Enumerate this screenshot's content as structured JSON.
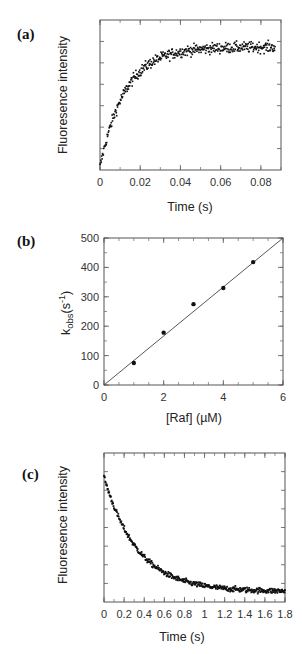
{
  "figure": {
    "panels": [
      {
        "id": "a",
        "label": "(a)"
      },
      {
        "id": "b",
        "label": "(b)"
      },
      {
        "id": "c",
        "label": "(c)"
      }
    ]
  },
  "chart_data": [
    {
      "panel": "(a)",
      "type": "scatter",
      "title": "",
      "xlabel": "Time (s)",
      "ylabel": "Fluoresence intensity",
      "xlim": [
        0,
        0.09
      ],
      "ylim": [
        0,
        1
      ],
      "xticks": [
        0,
        0.02,
        0.04,
        0.06,
        0.08
      ],
      "xtick_labels": [
        "0",
        "0.02",
        "0.04",
        "0.06",
        "0.08"
      ],
      "yticks_unlabeled": 7,
      "grid": false,
      "legend": null,
      "model": {
        "form": "single exponential rise",
        "y0": 0.02,
        "plateau": 0.82,
        "k": 80,
        "noise": 0.035,
        "n_points": 420,
        "t_max": 0.087
      },
      "series": [
        {
          "name": "Fluorescence (stopped-flow)",
          "x": [
            0,
            0.005,
            0.01,
            0.015,
            0.02,
            0.025,
            0.03,
            0.04,
            0.05,
            0.06,
            0.07,
            0.08,
            0.087
          ],
          "y": [
            0.02,
            0.28,
            0.46,
            0.59,
            0.67,
            0.72,
            0.75,
            0.79,
            0.81,
            0.82,
            0.82,
            0.82,
            0.82
          ]
        }
      ]
    },
    {
      "panel": "(b)",
      "type": "scatter",
      "title": "",
      "xlabel": "[Raf] (µM)",
      "ylabel": "k obs(s-1)",
      "ylabel_parts": {
        "k": "k",
        "sub": "obs",
        "rest": "(s",
        "sup": "-1",
        "close": ")"
      },
      "xlim": [
        0,
        6
      ],
      "ylim": [
        0,
        500
      ],
      "xticks": [
        0,
        2,
        4,
        6
      ],
      "xtick_labels": [
        "0",
        "2",
        "4",
        "6"
      ],
      "yticks": [
        0,
        100,
        200,
        300,
        400,
        500
      ],
      "ytick_labels": [
        "0",
        "100",
        "200",
        "300",
        "400",
        "500"
      ],
      "grid": false,
      "legend": null,
      "series": [
        {
          "name": "k_obs",
          "x": [
            1,
            2,
            3,
            4,
            5
          ],
          "y": [
            75,
            178,
            275,
            330,
            418
          ]
        },
        {
          "name": "linear fit",
          "type": "line",
          "x": [
            0,
            6
          ],
          "y": [
            0,
            500
          ]
        }
      ]
    },
    {
      "panel": "(c)",
      "type": "scatter",
      "title": "",
      "xlabel": "Time (s)",
      "ylabel": "Fluoresence intensity",
      "xlim": [
        0,
        1.8
      ],
      "ylim": [
        0,
        1
      ],
      "xticks": [
        0,
        0.2,
        0.4,
        0.6,
        0.8,
        1,
        1.2,
        1.4,
        1.6,
        1.8
      ],
      "xtick_labels": [
        "0",
        "0.2",
        "0.4",
        "0.6",
        "0.8",
        "1",
        "1.2",
        "1.4",
        "1.6",
        "1.8"
      ],
      "yticks_unlabeled": 8,
      "grid": false,
      "legend": null,
      "model": {
        "form": "single exponential decay",
        "y_end": 0.07,
        "amplitude": 0.77,
        "k": 3.0,
        "noise": 0.018,
        "n_points": 420,
        "t_max": 1.8
      },
      "series": [
        {
          "name": "Fluorescence (dissociation)",
          "x": [
            0,
            0.1,
            0.2,
            0.3,
            0.4,
            0.5,
            0.6,
            0.8,
            1.0,
            1.2,
            1.4,
            1.6,
            1.8
          ],
          "y": [
            0.84,
            0.64,
            0.49,
            0.38,
            0.3,
            0.24,
            0.19,
            0.14,
            0.11,
            0.09,
            0.08,
            0.08,
            0.07
          ]
        }
      ]
    }
  ]
}
